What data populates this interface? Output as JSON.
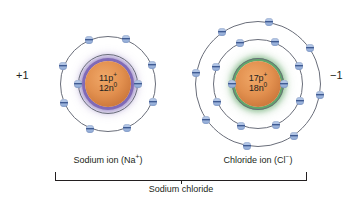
{
  "figure": {
    "background_color": "#ffffff"
  },
  "atoms": [
    {
      "id": "sodium",
      "nucleus": {
        "protons_label": "11p",
        "protons_charge": "+",
        "neutrons_label": "12n",
        "neutrons_charge": "0",
        "core_color": "#e2904f",
        "halo_color": "#7860b2"
      },
      "charge_label": "+1",
      "ion_name": "Sodium ion (Na",
      "ion_symbol_charge": "+",
      "ion_name_close": ")",
      "shells": [
        {
          "radius": 30,
          "electrons": 2,
          "start_angle": 180
        },
        {
          "radius": 48,
          "electrons": 8,
          "start_angle": 202
        }
      ]
    },
    {
      "id": "chloride",
      "nucleus": {
        "protons_label": "17p",
        "protons_charge": "+",
        "neutrons_label": "18n",
        "neutrons_charge": "0",
        "core_color": "#e2904f",
        "halo_color": "#56a060"
      },
      "charge_label": "−1",
      "ion_name": "Chloride ion (Cl",
      "ion_symbol_charge": "−",
      "ion_name_close": ")",
      "shells": [
        {
          "radius": 26,
          "electrons": 2,
          "start_angle": 180
        },
        {
          "radius": 45,
          "electrons": 8,
          "start_angle": 202
        },
        {
          "radius": 63,
          "electrons": 8,
          "start_angle": 190
        }
      ]
    }
  ],
  "bracket": {
    "caption": "Sodium chloride"
  },
  "colors": {
    "electron_blue": "#3f5b93",
    "shell_line": "#6a6e7a",
    "text": "#231f20"
  }
}
